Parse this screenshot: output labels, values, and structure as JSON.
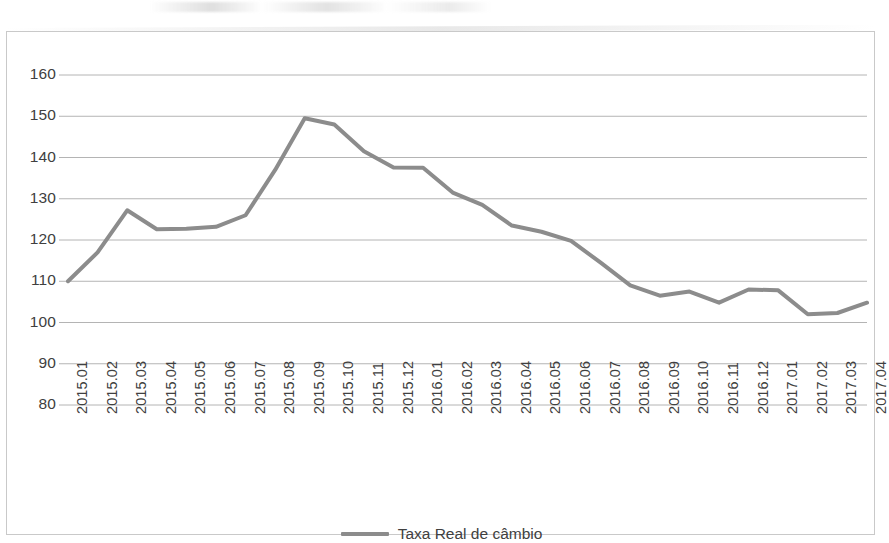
{
  "chart_data": {
    "type": "line",
    "title": "",
    "subtitle": "",
    "xlabel": "",
    "ylabel": "",
    "grid": true,
    "legend_position": "bottom-center",
    "ylim": [
      80,
      160
    ],
    "ytick_step": 10,
    "yticks": [
      "80",
      "90",
      "100",
      "110",
      "120",
      "130",
      "140",
      "150",
      "160"
    ],
    "categories": [
      "2015.01",
      "2015.02",
      "2015.03",
      "2015.04",
      "2015.05",
      "2015.06",
      "2015.07",
      "2015.08",
      "2015.09",
      "2015.10",
      "2015.11",
      "2015.12",
      "2016.01",
      "2016.02",
      "2016.03",
      "2016.04",
      "2016.05",
      "2016.06",
      "2016.07",
      "2016.08",
      "2016.09",
      "2016.10",
      "2016.11",
      "2016.12",
      "2017.01",
      "2017.02",
      "2017.03",
      "2017.04"
    ],
    "series": [
      {
        "name": "Taxa Real de câmbio",
        "color": "#8c8c8c",
        "values": [
          110.0,
          117.0,
          127.2,
          122.6,
          122.7,
          123.2,
          126.0,
          137.0,
          149.5,
          148.0,
          141.5,
          137.6,
          137.5,
          131.5,
          128.5,
          123.5,
          122.0,
          119.8,
          114.5,
          109.0,
          106.5,
          107.5,
          104.8,
          108.0,
          107.8,
          102.0,
          102.3,
          104.8
        ]
      }
    ]
  },
  "legend": {
    "items": [
      {
        "label": "Taxa Real de câmbio",
        "color": "#8c8c8c"
      }
    ]
  }
}
